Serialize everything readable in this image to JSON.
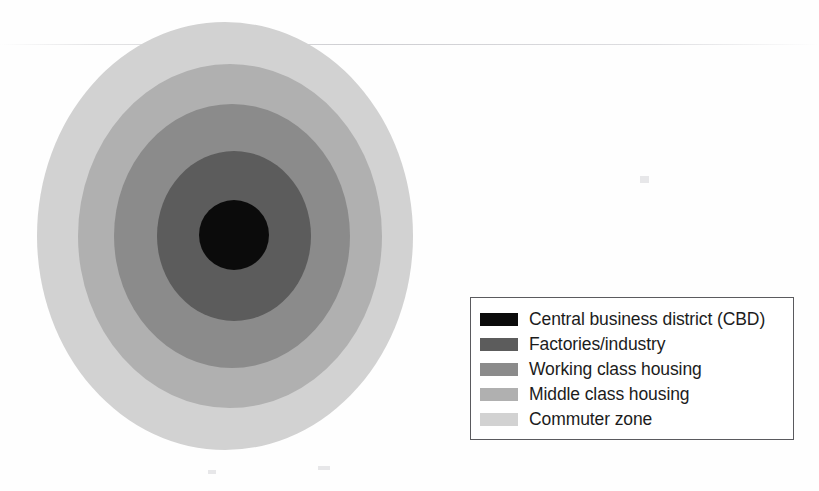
{
  "figure": {
    "type": "concentric-zone-diagram",
    "background_color": "#fefefe",
    "center": {
      "x": 234,
      "y": 236
    }
  },
  "chart_data": {
    "type": "pie",
    "xlabel": "",
    "ylabel": "",
    "categories": [
      "Central business district (CBD)",
      "Factories/industry",
      "Working class housing",
      "Middle class housing",
      "Commuter zone"
    ],
    "values": [
      1,
      2,
      3,
      4,
      5
    ],
    "colors": [
      "#0b0b0b",
      "#5c5c5c",
      "#8b8b8b",
      "#b0b0b0",
      "#d2d2d2"
    ],
    "legend_position": "bottom-right",
    "grid": false
  },
  "zones": [
    {
      "name": "commuter-zone",
      "label": "Commuter zone",
      "color": "#d2d2d2",
      "radius_x": 188,
      "radius_y": 214,
      "center_x": 225,
      "center_y": 236,
      "order": 5
    },
    {
      "name": "middle-class-housing",
      "label": "Middle class housing",
      "color": "#b0b0b0",
      "radius_x": 152,
      "radius_y": 172,
      "center_x": 230,
      "center_y": 236,
      "order": 4
    },
    {
      "name": "working-class-housing",
      "label": "Working class housing",
      "color": "#8b8b8b",
      "radius_x": 118,
      "radius_y": 132,
      "center_x": 232,
      "center_y": 236,
      "order": 3
    },
    {
      "name": "factories-industry",
      "label": "Factories/industry",
      "color": "#5c5c5c",
      "radius_x": 77,
      "radius_y": 85,
      "center_x": 234,
      "center_y": 236,
      "order": 2
    },
    {
      "name": "central-business-district",
      "label": "Central business district (CBD)",
      "color": "#0b0b0b",
      "radius_x": 35,
      "radius_y": 35,
      "center_x": 234,
      "center_y": 235,
      "order": 1
    }
  ],
  "legend": {
    "border_color": "#5a5a5e",
    "background_color": "#ffffff",
    "items": [
      {
        "label": "Central business district (CBD)",
        "color": "#0b0b0b",
        "swatch_name": "swatch-cbd"
      },
      {
        "label": "Factories/industry",
        "color": "#5c5c5c",
        "swatch_name": "swatch-factories"
      },
      {
        "label": "Working class housing",
        "color": "#8b8b8b",
        "swatch_name": "swatch-working-class"
      },
      {
        "label": "Middle class housing",
        "color": "#b0b0b0",
        "swatch_name": "swatch-middle-class"
      },
      {
        "label": "Commuter zone",
        "color": "#d2d2d2",
        "swatch_name": "swatch-commuter"
      }
    ]
  }
}
